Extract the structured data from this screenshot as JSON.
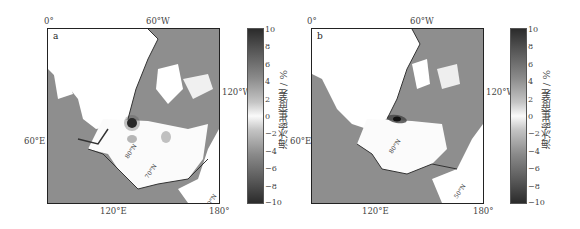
{
  "figure": {
    "panels": [
      {
        "letter": "a",
        "lon_labels": {
          "top_left": "0°",
          "top_center": "60°W",
          "right": "120°W",
          "left": "60°E",
          "bottom_center": "120°E",
          "bottom_right": "180°"
        },
        "lat_labels": [
          "80°N",
          "70°N",
          "60°N",
          "50°N"
        ],
        "anomaly": "strong positive spot near North Pole region (dark dot)"
      },
      {
        "letter": "b",
        "lon_labels": {
          "top_left": "0°",
          "top_center": "60°W",
          "right": "120°W",
          "left": "60°E",
          "bottom_center": "120°E",
          "bottom_right": "180°"
        },
        "lat_labels": [
          "80°N",
          "70°N",
          "60°N",
          "50°N"
        ],
        "anomaly": "elongated positive streak near North Pole region"
      }
    ],
    "colorbar": {
      "title": "海冰密集度差 / %",
      "ticks": [
        "10",
        "8",
        "6",
        "4",
        "2",
        "0",
        "−2",
        "−4",
        "−6",
        "−8",
        "−10"
      ],
      "min": -10,
      "max": 10
    },
    "colors": {
      "ocean_land": "#8e8e8e",
      "ice_zero": "#ffffff",
      "extreme": "#2b2b2b"
    }
  }
}
